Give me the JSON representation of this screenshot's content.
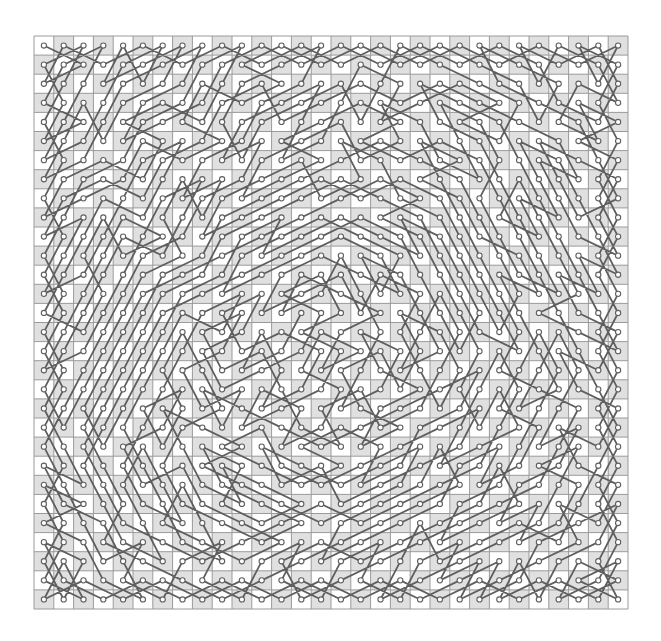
{
  "diagram": {
    "kind": "knights-tour",
    "board": {
      "rows": 30,
      "cols": 30
    },
    "layout": {
      "left": 34,
      "top": 36,
      "right": 628,
      "bottom": 609
    },
    "start_square": {
      "row": 0,
      "col": 0
    },
    "colors": {
      "background": "#ffffff",
      "light_square": "#ffffff",
      "dark_square": "#e0e0e0",
      "grid_line": "#9a9a9a",
      "path": "#5f5f5f",
      "node_fill": "#ffffff",
      "node_stroke": "#5f5f5f"
    },
    "node_radius": 2.6,
    "path_width": 1.8
  }
}
